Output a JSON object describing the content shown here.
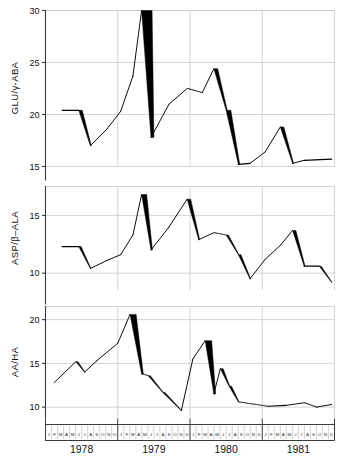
{
  "figure": {
    "title": "",
    "panel_count": 3,
    "background": "#ffffff",
    "line_color": "#000000",
    "grid_color": "#c9c9c9",
    "axis_color": "#3a3a3a"
  },
  "xaxis": {
    "label": "",
    "months": [
      "J",
      "F",
      "M",
      "A",
      "M",
      "J",
      "J",
      "A",
      "S",
      "O",
      "N",
      "D"
    ],
    "years": [
      "1978",
      "1979",
      "1980",
      "1981"
    ],
    "range_start": 1978.0,
    "range_end": 1982.0
  },
  "chart_data": [
    {
      "type": "line",
      "panel": 1,
      "title": "",
      "xlabel": "",
      "ylabel": "GLU/γ-ABA",
      "ylim": [
        15,
        30
      ],
      "yticks": [
        15,
        20,
        25,
        30
      ],
      "ytick_labels": [
        "15",
        "20",
        "25",
        "30"
      ],
      "xlim": [
        1978.0,
        1982.0
      ],
      "grid": true,
      "legend": "none",
      "style": "tapered-ribbon: descending segments drawn thick/filled, ascending segments thin",
      "x": [
        1978.23,
        1978.46,
        1978.62,
        1978.85,
        1979.04,
        1979.21,
        1979.33,
        1979.46,
        1979.71,
        1979.96,
        1980.17,
        1980.33,
        1980.5,
        1980.67,
        1980.83,
        1981.04,
        1981.25,
        1981.42,
        1981.58,
        1981.96
      ],
      "values": [
        20.4,
        20.4,
        17.0,
        18.6,
        20.3,
        23.7,
        30.0,
        17.8,
        21.0,
        22.5,
        22.1,
        24.4,
        20.4,
        15.2,
        15.3,
        16.4,
        18.8,
        15.3,
        15.6,
        15.7
      ]
    },
    {
      "type": "line",
      "panel": 2,
      "title": "",
      "xlabel": "",
      "ylabel": "ASP/β–ALA",
      "ylim": [
        8.5,
        17.5
      ],
      "yticks": [
        10,
        15
      ],
      "ytick_labels": [
        "10",
        "15"
      ],
      "xlim": [
        1978.0,
        1982.0
      ],
      "grid": true,
      "legend": "none",
      "style": "tapered-ribbon: descending segments drawn thick/filled, ascending segments thin",
      "x": [
        1978.23,
        1978.46,
        1978.62,
        1978.85,
        1979.04,
        1979.21,
        1979.33,
        1979.46,
        1979.71,
        1979.96,
        1980.12,
        1980.33,
        1980.5,
        1980.67,
        1980.83,
        1981.04,
        1981.25,
        1981.42,
        1981.58,
        1981.79,
        1981.96
      ],
      "values": [
        12.3,
        12.3,
        10.4,
        11.1,
        11.6,
        13.3,
        16.8,
        12.0,
        14.0,
        16.4,
        12.9,
        13.5,
        13.3,
        11.6,
        9.5,
        11.2,
        12.4,
        13.7,
        10.6,
        10.6,
        9.2
      ]
    },
    {
      "type": "line",
      "panel": 3,
      "title": "",
      "xlabel": "",
      "ylabel": "AA/HA",
      "ylim": [
        8.7,
        21.5
      ],
      "yticks": [
        10,
        15,
        20
      ],
      "ytick_labels": [
        "10",
        "15",
        "20"
      ],
      "xlim": [
        1978.0,
        1982.0
      ],
      "grid": true,
      "legend": "none",
      "style": "tapered-ribbon: descending segments drawn thick/filled, ascending segments thin",
      "x": [
        1978.12,
        1978.42,
        1978.54,
        1978.71,
        1979.0,
        1979.17,
        1979.33,
        1979.42,
        1979.62,
        1979.88,
        1980.04,
        1980.21,
        1980.33,
        1980.42,
        1980.54,
        1980.67,
        1980.83,
        1981.08,
        1981.33,
        1981.58,
        1981.75,
        1981.96
      ],
      "values": [
        12.8,
        15.2,
        14.0,
        15.3,
        17.3,
        20.6,
        13.8,
        13.6,
        11.7,
        9.6,
        15.5,
        17.6,
        11.5,
        14.4,
        12.4,
        10.6,
        10.4,
        10.1,
        10.2,
        10.5,
        10.0,
        10.3
      ]
    }
  ]
}
